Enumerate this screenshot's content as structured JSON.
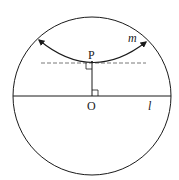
{
  "figure": {
    "labels": {
      "P": "P",
      "O": "O",
      "m": "m",
      "l": "l"
    },
    "colors": {
      "stroke": "#1a1a1a",
      "dashed": "#555555",
      "background": "#ffffff"
    },
    "elements": {
      "circle": {
        "cx": 92,
        "cy": 96,
        "r": 79
      },
      "line_l": {
        "x1": 13,
        "y1": 96,
        "x2": 171,
        "y2": 96
      },
      "dashed_line": {
        "x1": 41,
        "y1": 63,
        "x2": 146,
        "y2": 63
      },
      "perpendicular_PO": {
        "x1": 92,
        "y1": 62,
        "x2": 92,
        "y2": 96
      },
      "arc_m": {
        "start": [
          38,
          39
        ],
        "vertex": [
          92,
          62
        ],
        "end": [
          147,
          41
        ],
        "arrowheads": "both"
      }
    }
  }
}
